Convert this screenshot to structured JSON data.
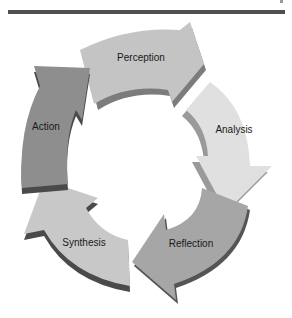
{
  "diagram": {
    "type": "cycle",
    "direction": "clockwise",
    "stages": [
      {
        "label": "Perception",
        "color": "#c4c4c4",
        "shadow": "#7c7c7c"
      },
      {
        "label": "Analysis",
        "color": "#e0e0e0",
        "shadow": "#9a9a9a"
      },
      {
        "label": "Reflection",
        "color": "#a6a6a6",
        "shadow": "#555555"
      },
      {
        "label": "Synthesis",
        "color": "#c8c8c8",
        "shadow": "#4a4a4a"
      },
      {
        "label": "Action",
        "color": "#8e8e8e",
        "shadow": "#4a4a4a"
      }
    ]
  }
}
